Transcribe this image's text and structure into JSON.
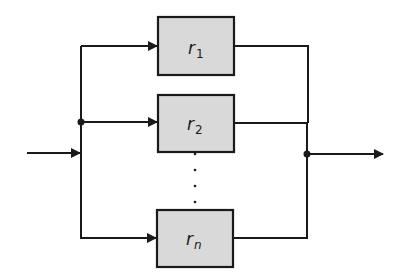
{
  "diagram": {
    "type": "parallel-reliability-block-diagram",
    "colors": {
      "block_fill": "#d9d9d9",
      "line": "#1a1a1a",
      "background": "#ffffff"
    },
    "blocks": [
      {
        "symbol": "r",
        "subscript": "1"
      },
      {
        "symbol": "r",
        "subscript": "2"
      },
      {
        "symbol": "r",
        "subscript": "n"
      }
    ],
    "ellipsis": "⋮",
    "input_label": "",
    "output_label": ""
  }
}
